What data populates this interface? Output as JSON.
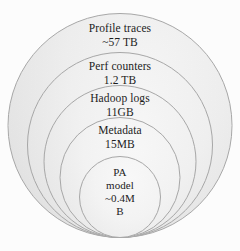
{
  "diagram": {
    "type": "nested-circles",
    "title": "",
    "background_color": "#ffffff",
    "outline_color": "#a9a9a9",
    "fill_color": "#eeeeee",
    "layers": [
      {
        "id": "profile-traces",
        "title": "Profile  traces",
        "value": "~57 TB",
        "order": 1
      },
      {
        "id": "perf-counters",
        "title": "Perf counters",
        "value": "1.2 TB",
        "order": 2
      },
      {
        "id": "hadoop-logs",
        "title": "Hadoop logs",
        "value": "11GB",
        "order": 3
      },
      {
        "id": "metadata",
        "title": "Metadata",
        "value": "15MB",
        "order": 4
      },
      {
        "id": "pa-model",
        "line1": "PA",
        "line2": "model",
        "line3": "~0.4M",
        "line4": "B",
        "order": 5
      }
    ]
  }
}
